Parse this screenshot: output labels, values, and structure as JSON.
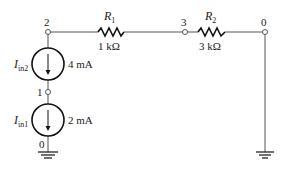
{
  "diagram": {
    "type": "electrical-circuit",
    "nodes": [
      {
        "id": "node-2",
        "label": "2"
      },
      {
        "id": "node-3",
        "label": "3"
      },
      {
        "id": "node-0-top",
        "label": "0"
      },
      {
        "id": "node-1",
        "label": "1"
      },
      {
        "id": "node-0-bottom",
        "label": "0"
      }
    ],
    "resistors": [
      {
        "name": "R",
        "sub": "1",
        "value": "1 kΩ",
        "from": "2",
        "to": "3"
      },
      {
        "name": "R",
        "sub": "2",
        "value": "3 kΩ",
        "from": "3",
        "to": "0"
      }
    ],
    "sources": [
      {
        "name": "I",
        "sub": "in2",
        "value": "4 mA",
        "from": "2",
        "to": "1",
        "direction": "down"
      },
      {
        "name": "I",
        "sub": "in1",
        "value": "2 mA",
        "from": "1",
        "to": "0",
        "direction": "down"
      }
    ],
    "grounds": [
      "bottom-left",
      "bottom-right"
    ]
  }
}
